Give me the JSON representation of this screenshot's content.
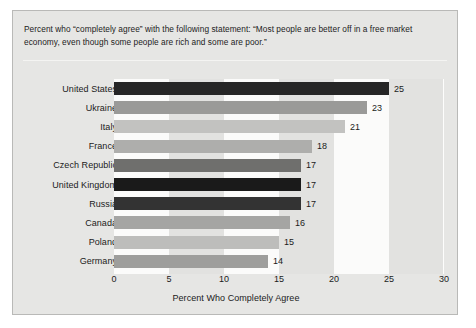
{
  "header": {
    "caption": "Percent who “completely agree” with the following statement: “Most people are better off in a free market economy, even though some people are rich and some are poor.”"
  },
  "chart_data": {
    "type": "bar",
    "orientation": "horizontal",
    "title": "",
    "xlabel": "Percent Who Completely Agree",
    "ylabel": "",
    "xlim": [
      0,
      30
    ],
    "xticks": [
      0,
      5,
      10,
      15,
      20,
      25,
      30
    ],
    "grid": "alternating vertical bands every 5 units",
    "legend": "none",
    "categories": [
      "United States",
      "Ukraine",
      "Italy",
      "France",
      "Czech Republic",
      "United Kingdom",
      "Russia",
      "Canada",
      "Poland",
      "Germany"
    ],
    "values": [
      25,
      23,
      21,
      18,
      17,
      17,
      17,
      16,
      15,
      14
    ],
    "value_labels": [
      "25",
      "23",
      "21",
      "18",
      "17",
      "17",
      "17",
      "16",
      "15",
      "14"
    ],
    "bar_colors": [
      "#262626",
      "#9a9a98",
      "#c2c2c0",
      "#aeaeac",
      "#6f6f6d",
      "#1a1a1a",
      "#333333",
      "#a5a5a3",
      "#bdbdbb",
      "#9e9e9c"
    ]
  },
  "colors": {
    "panel_background": "#e6e6e4",
    "panel_border": "#b9b9b7",
    "band_light": "#fbfbfa",
    "band_dark": "#e2e2e0",
    "text": "#1b1b1b"
  }
}
